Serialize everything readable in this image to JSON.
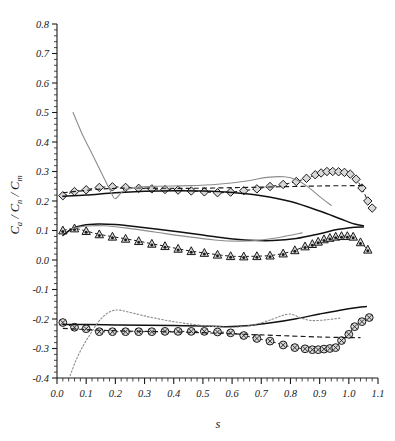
{
  "chart_data": {
    "type": "scatter",
    "title": "",
    "xlabel": "s",
    "ylabel": "C_a / C_n / C_m",
    "ylabel_parts": [
      "C",
      "a",
      " / ",
      "C",
      "n",
      " / ",
      "C",
      "m"
    ],
    "xlim": [
      0.0,
      1.1
    ],
    "ylim": [
      -0.4,
      0.8
    ],
    "grid": false,
    "legend": "none",
    "xticks": [
      "0.0",
      "0.1",
      "0.2",
      "0.3",
      "0.4",
      "0.5",
      "0.6",
      "0.7",
      "0.8",
      "0.9",
      "1.0",
      "1.1"
    ],
    "xtick_values": [
      0.0,
      0.1,
      0.2,
      0.3,
      0.4,
      0.5,
      0.6,
      0.7,
      0.8,
      0.9,
      1.0,
      1.1
    ],
    "yticks": [
      "0.8",
      "0.7",
      "0.6",
      "0.5",
      "0.4",
      "0.3",
      "0.2",
      "0.1",
      "0.0",
      "-0.1",
      "-0.2",
      "-0.3",
      "-0.4"
    ],
    "ytick_values": [
      0.8,
      0.7,
      0.6,
      0.5,
      0.4,
      0.3,
      0.2,
      0.1,
      0.0,
      -0.1,
      -0.2,
      -0.3,
      -0.4
    ],
    "minor_ticks_per_major": 5,
    "colors": {
      "marker_edge": "#1a1a1a",
      "marker_face": "#d8d8d8",
      "solid_black": "#111111",
      "gray_curve": "#8c8c8c",
      "dashed_black": "#1a1a1a"
    },
    "series": [
      {
        "name": "Cn-markers",
        "style": "diamond-markers-dashed",
        "marker": "diamond",
        "x": [
          0.02,
          0.06,
          0.1,
          0.145,
          0.19,
          0.235,
          0.28,
          0.325,
          0.37,
          0.415,
          0.46,
          0.505,
          0.55,
          0.595,
          0.64,
          0.685,
          0.73,
          0.775,
          0.82,
          0.855,
          0.885,
          0.905,
          0.925,
          0.945,
          0.965,
          0.985,
          1.005,
          1.025,
          1.045,
          1.065,
          1.08
        ],
        "y": [
          0.218,
          0.232,
          0.238,
          0.246,
          0.248,
          0.246,
          0.243,
          0.241,
          0.239,
          0.237,
          0.234,
          0.231,
          0.228,
          0.23,
          0.235,
          0.241,
          0.249,
          0.256,
          0.266,
          0.277,
          0.289,
          0.295,
          0.3,
          0.3,
          0.299,
          0.297,
          0.291,
          0.274,
          0.244,
          0.2,
          0.176
        ]
      },
      {
        "name": "Cn-dashed-fit",
        "style": "dashed",
        "x": [
          0.02,
          0.2,
          0.45,
          0.7,
          0.9,
          1.02,
          1.05
        ],
        "y": [
          0.228,
          0.243,
          0.243,
          0.247,
          0.251,
          0.252,
          0.252
        ]
      },
      {
        "name": "Cn-solid-black",
        "style": "solid-black",
        "x": [
          0.02,
          0.1,
          0.2,
          0.3,
          0.4,
          0.5,
          0.6,
          0.7,
          0.8,
          0.9,
          0.97,
          1.02,
          1.05
        ],
        "y": [
          0.216,
          0.22,
          0.228,
          0.233,
          0.235,
          0.234,
          0.229,
          0.218,
          0.198,
          0.166,
          0.14,
          0.122,
          0.116
        ]
      },
      {
        "name": "Cn-gray-steep",
        "style": "gray",
        "x": [
          0.055,
          0.085,
          0.12,
          0.155,
          0.185,
          0.2,
          0.23,
          0.28,
          0.35,
          0.45,
          0.55,
          0.65,
          0.72,
          0.78,
          0.82,
          0.86,
          0.9,
          0.94
        ],
        "y": [
          0.5,
          0.43,
          0.36,
          0.29,
          0.23,
          0.208,
          0.236,
          0.247,
          0.25,
          0.252,
          0.257,
          0.268,
          0.28,
          0.282,
          0.272,
          0.248,
          0.215,
          0.185
        ]
      },
      {
        "name": "Cm-markers",
        "style": "triangle-markers-dashed",
        "marker": "triangle",
        "x": [
          0.02,
          0.06,
          0.1,
          0.145,
          0.19,
          0.235,
          0.28,
          0.325,
          0.37,
          0.415,
          0.46,
          0.505,
          0.55,
          0.595,
          0.64,
          0.685,
          0.73,
          0.775,
          0.815,
          0.85,
          0.875,
          0.895,
          0.915,
          0.935,
          0.955,
          0.975,
          0.995,
          1.015,
          1.04,
          1.065
        ],
        "y": [
          0.1,
          0.107,
          0.098,
          0.087,
          0.079,
          0.072,
          0.064,
          0.055,
          0.047,
          0.038,
          0.03,
          0.024,
          0.018,
          0.013,
          0.012,
          0.013,
          0.015,
          0.022,
          0.033,
          0.046,
          0.054,
          0.062,
          0.07,
          0.075,
          0.079,
          0.081,
          0.081,
          0.079,
          0.06,
          0.035
        ]
      },
      {
        "name": "Cm-solid-upper",
        "style": "solid-black",
        "x": [
          0.02,
          0.05,
          0.09,
          0.14,
          0.2,
          0.28,
          0.38,
          0.48,
          0.58,
          0.66,
          0.74,
          0.82,
          0.9,
          0.96,
          1.02,
          1.05
        ],
        "y": [
          0.083,
          0.105,
          0.118,
          0.122,
          0.12,
          0.112,
          0.1,
          0.087,
          0.074,
          0.067,
          0.066,
          0.073,
          0.089,
          0.103,
          0.111,
          0.112
        ]
      },
      {
        "name": "Cm-gray",
        "style": "gray",
        "x": [
          0.05,
          0.1,
          0.16,
          0.24,
          0.34,
          0.44,
          0.54,
          0.62,
          0.7,
          0.78,
          0.84
        ],
        "y": [
          0.106,
          0.115,
          0.116,
          0.108,
          0.094,
          0.08,
          0.068,
          0.064,
          0.068,
          0.08,
          0.092
        ]
      },
      {
        "name": "Ca-markers",
        "style": "circle-markers-dashed",
        "marker": "circle",
        "x": [
          0.02,
          0.06,
          0.1,
          0.145,
          0.19,
          0.235,
          0.28,
          0.325,
          0.37,
          0.415,
          0.46,
          0.505,
          0.55,
          0.595,
          0.64,
          0.685,
          0.73,
          0.775,
          0.815,
          0.85,
          0.875,
          0.895,
          0.915,
          0.935,
          0.955,
          0.975,
          1.0,
          1.02,
          1.045,
          1.07
        ],
        "y": [
          -0.212,
          -0.228,
          -0.233,
          -0.243,
          -0.243,
          -0.243,
          -0.243,
          -0.243,
          -0.242,
          -0.242,
          -0.242,
          -0.242,
          -0.244,
          -0.247,
          -0.256,
          -0.266,
          -0.275,
          -0.288,
          -0.297,
          -0.301,
          -0.304,
          -0.304,
          -0.302,
          -0.3,
          -0.297,
          -0.273,
          -0.252,
          -0.226,
          -0.209,
          -0.195
        ]
      },
      {
        "name": "Ca-dashed-fit",
        "style": "dashed",
        "x": [
          0.02,
          0.2,
          0.45,
          0.7,
          0.9,
          1.0,
          1.04
        ],
        "y": [
          -0.232,
          -0.24,
          -0.245,
          -0.254,
          -0.261,
          -0.263,
          -0.263
        ]
      },
      {
        "name": "Ca-solid-black",
        "style": "solid-black",
        "x": [
          0.02,
          0.1,
          0.2,
          0.3,
          0.4,
          0.5,
          0.58,
          0.66,
          0.74,
          0.82,
          0.9,
          0.97,
          1.03,
          1.06
        ],
        "y": [
          -0.219,
          -0.219,
          -0.22,
          -0.221,
          -0.222,
          -0.224,
          -0.226,
          -0.222,
          -0.212,
          -0.199,
          -0.183,
          -0.17,
          -0.161,
          -0.158
        ]
      },
      {
        "name": "Ca-gray-dotted",
        "style": "gray-dotted",
        "x": [
          0.045,
          0.065,
          0.09,
          0.115,
          0.14,
          0.165,
          0.19,
          0.215,
          0.26,
          0.32,
          0.4,
          0.48,
          0.55,
          0.6,
          0.65,
          0.7,
          0.74,
          0.77,
          0.8,
          0.83,
          0.87,
          0.92,
          0.97
        ],
        "y": [
          -0.392,
          -0.34,
          -0.29,
          -0.25,
          -0.212,
          -0.186,
          -0.172,
          -0.17,
          -0.18,
          -0.194,
          -0.209,
          -0.22,
          -0.226,
          -0.228,
          -0.224,
          -0.213,
          -0.2,
          -0.189,
          -0.183,
          -0.194,
          -0.205,
          -0.203,
          -0.197
        ]
      }
    ]
  }
}
